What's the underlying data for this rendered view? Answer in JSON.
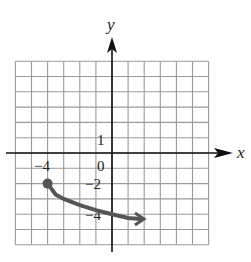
{
  "chart_data": {
    "type": "line",
    "title": "",
    "xlabel": "x",
    "ylabel": "y",
    "xlim": [
      -6,
      6
    ],
    "ylim": [
      -6,
      6
    ],
    "grid": true,
    "grid_step": 1,
    "tick_labels": {
      "x": [
        {
          "value": -4,
          "label": "−4"
        }
      ],
      "y": [
        {
          "value": 1,
          "label": "1"
        },
        {
          "value": -2,
          "label": "−2"
        },
        {
          "value": -4,
          "label": "−4"
        }
      ],
      "origin": "0"
    },
    "series": [
      {
        "name": "curve",
        "description": "Curve starting at closed point (-4,-2), decreasing and flattening, ending in an arrow near (1.8,-4.3)",
        "start_point": {
          "x": -4,
          "y": -2,
          "marker": "closed-dot"
        },
        "end": "arrow",
        "x": [
          -4,
          -3.5,
          -3,
          -2,
          -1,
          0,
          1,
          1.8
        ],
        "y": [
          -2,
          -2.71,
          -3.0,
          -3.41,
          -3.73,
          -4.0,
          -4.24,
          -4.32
        ],
        "color": "#555555"
      }
    ]
  },
  "labels": {
    "x_axis": "x",
    "y_axis": "y",
    "origin": "0",
    "y_one": "1",
    "y_minus_two": "−2",
    "y_minus_four": "−4",
    "x_minus_four": "−4"
  }
}
